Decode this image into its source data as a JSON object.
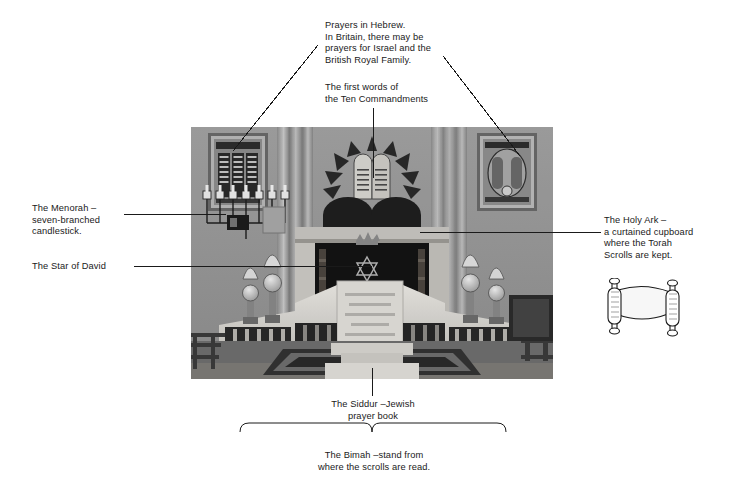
{
  "page": {
    "background": "#ffffff",
    "ink": "#1a1a1a"
  },
  "photo": {
    "alt": "Black and white photograph of the interior of a synagogue showing the bimah, the Holy Ark, a menorah and Hebrew plaques",
    "x": 191,
    "y": 127,
    "width": 362,
    "height": 252,
    "tones": {
      "wall": "#9a9a9a",
      "wall_light": "#b4b4b4",
      "curtain": "#8a8a8a",
      "ark_dark": "#1d1d1d",
      "bimah_white": "#e6e5e2",
      "floor": "#6e6e6e",
      "carpet": "#3b3b3b"
    }
  },
  "annotations": [
    {
      "id": "prayers-in-hebrew",
      "name": "annotation-prayers-in-hebrew",
      "text": "Prayers in Hebrew.\nIn Britain, there may be\nprayers for Israel and the\nBritish Royal Family.",
      "align": "left",
      "x": 325,
      "y": 20
    },
    {
      "id": "ten-commandments",
      "name": "annotation-ten-commandments",
      "text": "The first words of\nthe Ten Commandments",
      "align": "left",
      "x": 325,
      "y": 82
    },
    {
      "id": "menorah",
      "name": "annotation-menorah",
      "text": "The Menorah –\nseven-branched\ncandlestick.",
      "align": "left",
      "x": 32,
      "y": 203
    },
    {
      "id": "star-of-david",
      "name": "annotation-star-of-david",
      "text": "The Star of David",
      "align": "left",
      "x": 32,
      "y": 261
    },
    {
      "id": "holy-ark",
      "name": "annotation-holy-ark",
      "text": "The Holy Ark –\na curtained cupboard\nwhere the Torah\nScrolls are kept.",
      "align": "left",
      "x": 604,
      "y": 215
    },
    {
      "id": "siddur",
      "name": "annotation-siddur",
      "text": "The Siddur –Jewish\nprayer book",
      "align": "center",
      "x": 310,
      "y": 399
    },
    {
      "id": "bimah",
      "name": "annotation-bimah",
      "text": "The Bimah –stand from\nwhere the scrolls are read.",
      "align": "center",
      "x": 300,
      "y": 450
    }
  ],
  "leader_lines": [
    {
      "id": "line-prayers-left",
      "name": "leader-line-prayers-left",
      "type": "diagonal",
      "x1": 318,
      "y1": 45,
      "x2": 233,
      "y2": 151
    },
    {
      "id": "line-prayers-right",
      "name": "leader-line-prayers-right",
      "type": "diagonal",
      "x1": 443,
      "y1": 56,
      "x2": 520,
      "y2": 156
    },
    {
      "id": "line-commandments",
      "name": "leader-line-commandments",
      "type": "vertical",
      "x1": 373,
      "y1": 108,
      "x2": 373,
      "y2": 178
    },
    {
      "id": "line-menorah",
      "name": "leader-line-menorah",
      "type": "horizontal",
      "x1": 124,
      "y1": 214,
      "x2": 226,
      "y2": 214
    },
    {
      "id": "line-star",
      "name": "leader-line-star-of-david",
      "type": "horizontal",
      "x1": 134,
      "y1": 266,
      "x2": 372,
      "y2": 266
    },
    {
      "id": "line-holy-ark",
      "name": "leader-line-holy-ark",
      "type": "horizontal",
      "x1": 420,
      "y1": 232,
      "x2": 601,
      "y2": 232
    },
    {
      "id": "line-siddur",
      "name": "leader-line-siddur",
      "type": "vertical",
      "x1": 372,
      "y1": 368,
      "x2": 372,
      "y2": 396
    }
  ],
  "brace": {
    "name": "bimah-brace",
    "left": 240,
    "right": 506,
    "top": 432,
    "pointer_x": 372,
    "drop": 10
  },
  "torah_scroll_icon": {
    "name": "torah-scroll-icon",
    "label": "torah-scroll-illustration",
    "x": 600,
    "y": 278,
    "width": 88,
    "height": 62
  }
}
